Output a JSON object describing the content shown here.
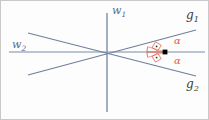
{
  "figure": {
    "width": 209,
    "height": 120,
    "background_color": "#fdfdfd",
    "border_color": "#c8c8c8"
  },
  "colors": {
    "axis": "#6b7a99",
    "line": "#6b7a99",
    "angle_marker": "#e2624a",
    "angle_label": "#e2624a",
    "point": "#000000",
    "axis_label": "#5a6a8c",
    "line_label": "#3b3b3b"
  },
  "labels": {
    "axis_vertical": "w",
    "axis_vertical_sub": "1",
    "axis_horizontal": "w",
    "axis_horizontal_sub": "2",
    "line_upper": "g",
    "line_upper_sub": "1",
    "line_lower": "g",
    "line_lower_sub": "2",
    "angle_upper": "α",
    "angle_lower": "α"
  },
  "geometry": {
    "origin": {
      "x": 106,
      "y": 52
    },
    "marked_point": {
      "x": 165,
      "y": 52
    },
    "axis_vertical": {
      "x1": 107,
      "y1": 13,
      "x2": 107,
      "y2": 112
    },
    "axis_horizontal": {
      "x1": 9,
      "y1": 52,
      "x2": 205,
      "y2": 52
    },
    "line_g1": {
      "x1": 28,
      "y1": 75,
      "x2": 196,
      "y2": 30
    },
    "line_g2": {
      "x1": 28,
      "y1": 33,
      "x2": 196,
      "y2": 76
    },
    "angle_arc_upper": {
      "cx": 165,
      "cy": 52,
      "radius": 18,
      "from_deg": 180,
      "to_deg": 165
    },
    "angle_arc_lower": {
      "cx": 165,
      "cy": 52,
      "radius": 18,
      "from_deg": 180,
      "to_deg": 195
    },
    "right_angle_dot_upper": {
      "x": 158,
      "y": 43
    },
    "right_angle_dot_lower": {
      "x": 158,
      "y": 61
    }
  }
}
